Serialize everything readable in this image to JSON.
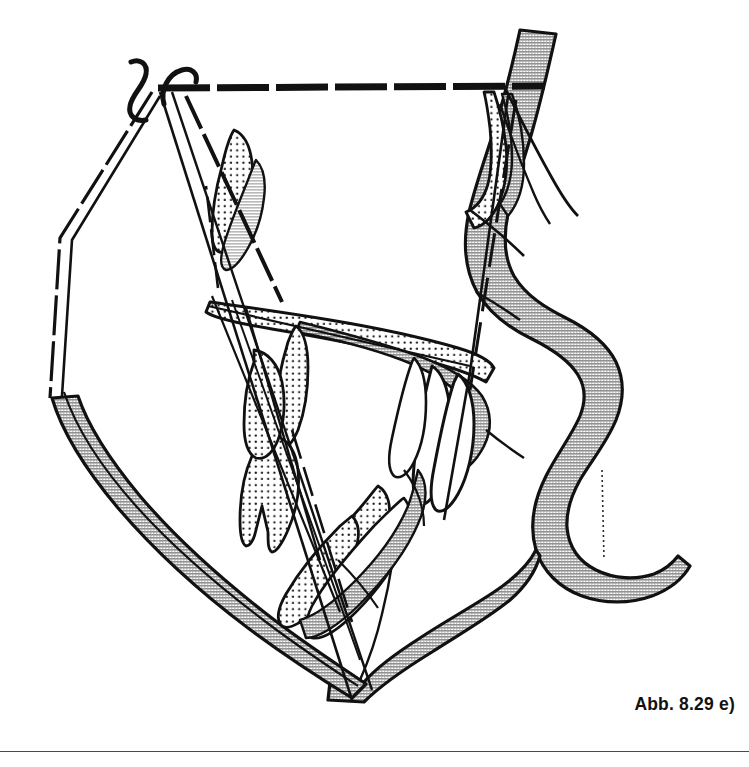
{
  "figure": {
    "caption": "Abb. 8.29 e)",
    "type": "cephalometric-superimposition-tracing",
    "width": 749,
    "height": 767
  },
  "colors": {
    "ink": "#111111",
    "stipple_dot": "#1a1a1a",
    "hatch_gray": "#a9a9a9",
    "hatch_gray_light": "#bdbdbd",
    "paper": "#ffffff",
    "rule": "#4a4a4a"
  },
  "reference_lines": {
    "sn_line": {
      "name": "sella-nasion-line",
      "style": "thick-dashed",
      "from": [
        158,
        88
      ],
      "to": [
        545,
        86
      ]
    },
    "left_construction_lines": {
      "name": "left-construction-lines",
      "style": "thin-dashed-and-solid",
      "count": 3
    },
    "tooth_axis_lines": {
      "name": "tooth-long-axis-lines",
      "style": "thin-dashed",
      "count": 3
    }
  },
  "landmarks": {
    "sella_hooks": [
      {
        "name": "sella-hook-left",
        "x": 140,
        "y": 78
      },
      {
        "name": "sella-hook-right",
        "x": 176,
        "y": 76
      }
    ]
  },
  "structures": [
    {
      "name": "soft-tissue-profile-band",
      "fill": "hatch"
    },
    {
      "name": "mandible-body-band",
      "fill": "hatch"
    },
    {
      "name": "palate-maxilla",
      "fill": "stipple"
    },
    {
      "name": "upper-incisor-stippled",
      "fill": "stipple"
    },
    {
      "name": "lower-incisor-stippled",
      "fill": "stipple"
    },
    {
      "name": "upper-incisor-outline",
      "fill": "white"
    },
    {
      "name": "lower-incisor-outline",
      "fill": "white"
    },
    {
      "name": "posterior-nasal-structure",
      "fill": "stipple"
    },
    {
      "name": "lip-upper",
      "fill": "hatch"
    },
    {
      "name": "lip-lower",
      "fill": "hatch"
    },
    {
      "name": "chin-soft-tissue",
      "fill": "hatch"
    }
  ]
}
